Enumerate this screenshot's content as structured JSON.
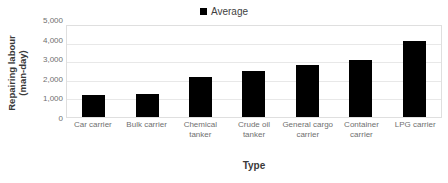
{
  "chart_data": {
    "type": "bar",
    "title": "",
    "categories": [
      "Car carrier",
      "Bulk carrier",
      "Chemical tanker",
      "Crude oil tanker",
      "General cargo carrier",
      "Container carrier",
      "LPG carrier"
    ],
    "series": [
      {
        "name": "Average",
        "values": [
          1200,
          1280,
          2220,
          2550,
          2850,
          3160,
          4180
        ],
        "color": "#000000"
      }
    ],
    "values": [
      1200,
      1280,
      2220,
      2550,
      2850,
      3160,
      4180
    ],
    "xlabel": "Type",
    "ylabel": "Repairing labour (man-day)",
    "ylabel_line1": "Repairing labour",
    "ylabel_line2": "(man-day)",
    "ylim": [
      0,
      5000
    ],
    "ytick_values": [
      5000,
      4000,
      3000,
      2000,
      1000,
      0
    ],
    "ytick_labels": [
      "5,000",
      "4,000",
      "3,000",
      "2,000",
      "1,000",
      "0"
    ],
    "grid": true,
    "legend_position": "top-center",
    "legend_entries": [
      "Average"
    ]
  },
  "legend": {
    "average_label": "Average"
  },
  "axes": {
    "y_title": "Repairing labour (man-day)",
    "x_title": "Type"
  }
}
